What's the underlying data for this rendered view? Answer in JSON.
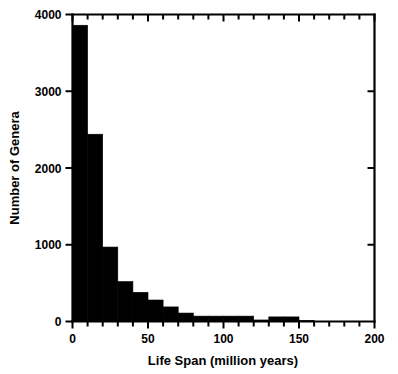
{
  "chart_data": {
    "type": "bar",
    "title": "",
    "subtitle": "",
    "xlabel": "Life Span (million years)",
    "ylabel": "Number of Genera",
    "xlim": [
      0,
      200
    ],
    "ylim": [
      0,
      4000
    ],
    "xticks": [
      0,
      50,
      100,
      150,
      200
    ],
    "xtick_labels": [
      "0",
      "50",
      "100",
      "150",
      "200"
    ],
    "yticks": [
      0,
      1000,
      2000,
      3000,
      4000
    ],
    "ytick_labels": [
      "0",
      "1000",
      "2000",
      "3000",
      "4000"
    ],
    "minor_xtick_step": 10,
    "grid": false,
    "legend": null,
    "bar_color": "#000000",
    "bin_width": 10,
    "bin_edges": [
      0,
      10,
      20,
      30,
      40,
      50,
      60,
      70,
      80,
      90,
      100,
      110,
      120,
      130,
      140,
      150,
      160
    ],
    "categories": [
      "0-10",
      "10-20",
      "20-30",
      "30-40",
      "40-50",
      "50-60",
      "60-70",
      "70-80",
      "80-90",
      "90-100",
      "100-110",
      "110-120",
      "120-130",
      "130-140",
      "140-150",
      "150-160"
    ],
    "values": [
      3860,
      2440,
      970,
      520,
      380,
      280,
      190,
      110,
      70,
      70,
      70,
      70,
      20,
      60,
      60,
      15
    ],
    "annotations": []
  },
  "axis": {
    "ylabel": "Number of Genera",
    "xlabel": "Life Span (million years)"
  }
}
